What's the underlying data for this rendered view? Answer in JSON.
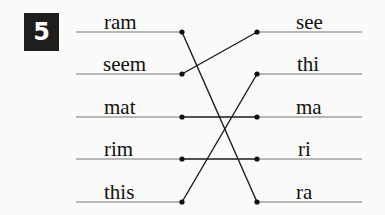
{
  "exercise": {
    "number": "5",
    "left_words": [
      "ram",
      "seem",
      "mat",
      "rim",
      "this"
    ],
    "right_words": [
      "see",
      "thi",
      "ma",
      "ri",
      "ra"
    ],
    "connections": [
      {
        "from": "ram",
        "to": "ra"
      },
      {
        "from": "seem",
        "to": "see"
      },
      {
        "from": "mat",
        "to": "ma"
      },
      {
        "from": "rim",
        "to": "ri"
      },
      {
        "from": "this",
        "to": "thi"
      }
    ]
  }
}
